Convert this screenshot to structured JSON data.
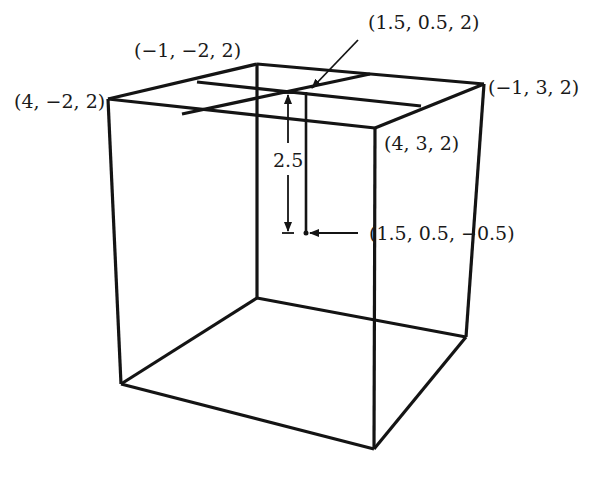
{
  "diagram": {
    "labels": {
      "top_back_left": "(−1, −2, 2)",
      "top_front_left": "(4, −2, 2)",
      "top_back_right": "(−1, 3, 2)",
      "top_front_right": "(4, 3, 2)",
      "top_center": "(1.5, 0.5, 2)",
      "inner_point": "(1.5, 0.5, −0.5)",
      "distance": "2.5"
    },
    "colors": {
      "line": "#141414",
      "background": "#ffffff"
    }
  }
}
